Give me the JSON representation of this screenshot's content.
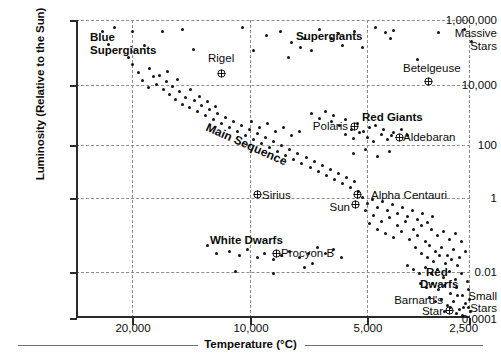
{
  "chart_data": {
    "type": "scatter",
    "xlabel": "Temperature",
    "xunit": "(°C)",
    "ylabel": "Luminosity (Relative to the Sun)",
    "xlim": [
      25000,
      2500
    ],
    "ylim": [
      0.0001,
      1000000
    ],
    "xscale": "reversed-linear-ish",
    "yscale": "log",
    "grid": true,
    "legend": "none",
    "xticks": [
      {
        "label": "20,000",
        "value": 20000
      },
      {
        "label": "10,000",
        "value": 10000
      },
      {
        "label": "5,000",
        "value": 5000
      },
      {
        "label": "2,500",
        "value": 2500
      }
    ],
    "yticks": [
      {
        "label": "1,000,000",
        "value": 1000000
      },
      {
        "label": "10,000",
        "value": 10000
      },
      {
        "label": "100",
        "value": 100
      },
      {
        "label": "1",
        "value": 1
      },
      {
        "label": "0.01",
        "value": 0.01
      },
      {
        "label": "0.0001",
        "value": 0.0001
      }
    ],
    "y_axis_extra_labels": [
      {
        "label": "Massive",
        "near": "1,000,000"
      },
      {
        "label": "Stars",
        "near": "1,000,000"
      },
      {
        "label": "Small",
        "near": "0.0001"
      },
      {
        "label": "Stars",
        "near": "0.0001"
      }
    ],
    "region_labels": [
      {
        "name": "Blue Supergiants",
        "lines": [
          "Blue",
          "Supergiants"
        ]
      },
      {
        "name": "Supergiants",
        "lines": [
          "Supergiants"
        ]
      },
      {
        "name": "Main Sequence",
        "lines": [
          "Main Sequence"
        ]
      },
      {
        "name": "Red Giants",
        "lines": [
          "Red Giants"
        ]
      },
      {
        "name": "White Dwarfs",
        "lines": [
          "White Dwarfs"
        ]
      },
      {
        "name": "Red Dwarfs",
        "lines": [
          "Red",
          "Dwarfs"
        ]
      }
    ],
    "named_stars": [
      {
        "name": "Rigel",
        "lines": [
          "Rigel"
        ],
        "temperature": 11000,
        "luminosity": 40000
      },
      {
        "name": "Betelgeuse",
        "lines": [
          "Betelgeuse"
        ],
        "temperature": 3500,
        "luminosity": 14000
      },
      {
        "name": "Polaris",
        "lines": [
          "Polaris"
        ],
        "temperature": 6000,
        "luminosity": 200
      },
      {
        "name": "Aldebaran",
        "lines": [
          "Aldebaran"
        ],
        "temperature": 4000,
        "luminosity": 120
      },
      {
        "name": "Sirius",
        "lines": [
          "Sirius"
        ],
        "temperature": 9500,
        "luminosity": 1.2
      },
      {
        "name": "Alpha Centauri",
        "lines": [
          "Alpha Centauri"
        ],
        "temperature": 5500,
        "luminosity": 1.2
      },
      {
        "name": "Sun",
        "lines": [
          "Sun"
        ],
        "temperature": 5500,
        "luminosity": 1
      },
      {
        "name": "Procyon B",
        "lines": [
          "Procyon B"
        ],
        "temperature": 8000,
        "luminosity": 0.02
      },
      {
        "name": "Barnard's Star",
        "lines": [
          "Barnard's",
          "Star"
        ],
        "temperature": 3000,
        "luminosity": 0.0005
      }
    ],
    "series": [
      {
        "name": "stars",
        "marker": "dot",
        "color": "#121212",
        "points_px": [
          [
            101,
            30
          ],
          [
            113,
            26
          ],
          [
            107,
            43
          ],
          [
            127,
            56
          ],
          [
            131,
            30
          ],
          [
            143,
            44
          ],
          [
            161,
            30
          ],
          [
            181,
            28
          ],
          [
            192,
            48
          ],
          [
            241,
            26
          ],
          [
            252,
            49
          ],
          [
            265,
            34
          ],
          [
            279,
            30
          ],
          [
            287,
            56
          ],
          [
            290,
            41
          ],
          [
            299,
            46
          ],
          [
            303,
            37
          ],
          [
            310,
            49
          ],
          [
            318,
            28
          ],
          [
            330,
            37
          ],
          [
            337,
            32
          ],
          [
            341,
            44
          ],
          [
            353,
            30
          ],
          [
            361,
            46
          ],
          [
            374,
            26
          ],
          [
            384,
            31
          ],
          [
            389,
            37
          ],
          [
            392,
            29
          ],
          [
            416,
            58
          ],
          [
            437,
            31
          ],
          [
            463,
            28
          ],
          [
            470,
            40
          ],
          [
            131,
            63
          ],
          [
            137,
            71
          ],
          [
            141,
            79
          ],
          [
            148,
            67
          ],
          [
            152,
            75
          ],
          [
            147,
            86
          ],
          [
            155,
            83
          ],
          [
            158,
            74
          ],
          [
            162,
            88
          ],
          [
            165,
            80
          ],
          [
            168,
            93
          ],
          [
            171,
            85
          ],
          [
            174,
            98
          ],
          [
            178,
            90
          ],
          [
            181,
            103
          ],
          [
            166,
            70
          ],
          [
            176,
            78
          ],
          [
            184,
            96
          ],
          [
            188,
            106
          ],
          [
            193,
            99
          ],
          [
            196,
            110
          ],
          [
            200,
            104
          ],
          [
            204,
            114
          ],
          [
            208,
            108
          ],
          [
            212,
            118
          ],
          [
            216,
            112
          ],
          [
            220,
            122
          ],
          [
            224,
            116
          ],
          [
            228,
            126
          ],
          [
            232,
            120
          ],
          [
            236,
            130
          ],
          [
            240,
            124
          ],
          [
            189,
            88
          ],
          [
            198,
            95
          ],
          [
            206,
            100
          ],
          [
            214,
            105
          ],
          [
            244,
            134
          ],
          [
            248,
            128
          ],
          [
            252,
            138
          ],
          [
            256,
            132
          ],
          [
            260,
            142
          ],
          [
            264,
            136
          ],
          [
            268,
            146
          ],
          [
            272,
            140
          ],
          [
            276,
            150
          ],
          [
            280,
            144
          ],
          [
            284,
            154
          ],
          [
            288,
            148
          ],
          [
            292,
            158
          ],
          [
            296,
            152
          ],
          [
            300,
            162
          ],
          [
            250,
            120
          ],
          [
            258,
            126
          ],
          [
            266,
            122
          ],
          [
            274,
            130
          ],
          [
            282,
            126
          ],
          [
            290,
            134
          ],
          [
            298,
            130
          ],
          [
            305,
            156
          ],
          [
            309,
            166
          ],
          [
            313,
            160
          ],
          [
            317,
            170
          ],
          [
            321,
            164
          ],
          [
            325,
            174
          ],
          [
            329,
            168
          ],
          [
            333,
            178
          ],
          [
            337,
            172
          ],
          [
            341,
            182
          ],
          [
            345,
            176
          ],
          [
            349,
            186
          ],
          [
            353,
            180
          ],
          [
            357,
            190
          ],
          [
            330,
            120
          ],
          [
            338,
            124
          ],
          [
            344,
            118
          ],
          [
            350,
            128
          ],
          [
            356,
            122
          ],
          [
            362,
            130
          ],
          [
            368,
            126
          ],
          [
            310,
            112
          ],
          [
            318,
            117
          ],
          [
            324,
            110
          ],
          [
            332,
            114
          ],
          [
            344,
            133
          ],
          [
            352,
            137
          ],
          [
            358,
            131
          ],
          [
            366,
            136
          ],
          [
            372,
            140
          ],
          [
            380,
            133
          ],
          [
            386,
            138
          ],
          [
            392,
            131
          ],
          [
            374,
            124
          ],
          [
            382,
            128
          ],
          [
            390,
            134
          ],
          [
            400,
            128
          ],
          [
            406,
            134
          ],
          [
            352,
            152
          ],
          [
            364,
            148
          ],
          [
            376,
            155
          ],
          [
            388,
            150
          ],
          [
            361,
            196
          ],
          [
            366,
            202
          ],
          [
            371,
            198
          ],
          [
            376,
            206
          ],
          [
            381,
            200
          ],
          [
            386,
            209
          ],
          [
            391,
            203
          ],
          [
            396,
            212
          ],
          [
            401,
            206
          ],
          [
            406,
            215
          ],
          [
            411,
            209
          ],
          [
            416,
            218
          ],
          [
            421,
            212
          ],
          [
            426,
            221
          ],
          [
            431,
            215
          ],
          [
            364,
            209
          ],
          [
            372,
            214
          ],
          [
            380,
            220
          ],
          [
            388,
            216
          ],
          [
            396,
            224
          ],
          [
            404,
            220
          ],
          [
            412,
            228
          ],
          [
            420,
            224
          ],
          [
            368,
            222
          ],
          [
            376,
            228
          ],
          [
            384,
            232
          ],
          [
            392,
            236
          ],
          [
            400,
            230
          ],
          [
            408,
            238
          ],
          [
            416,
            234
          ],
          [
            424,
            240
          ],
          [
            430,
            228
          ],
          [
            436,
            234
          ],
          [
            442,
            230
          ],
          [
            448,
            238
          ],
          [
            454,
            232
          ],
          [
            460,
            240
          ],
          [
            428,
            244
          ],
          [
            434,
            250
          ],
          [
            440,
            246
          ],
          [
            446,
            254
          ],
          [
            452,
            248
          ],
          [
            458,
            256
          ],
          [
            464,
            250
          ],
          [
            414,
            246
          ],
          [
            420,
            252
          ],
          [
            426,
            256
          ],
          [
            432,
            260
          ],
          [
            438,
            254
          ],
          [
            444,
            262
          ],
          [
            450,
            258
          ],
          [
            456,
            264
          ],
          [
            424,
            266
          ],
          [
            430,
            272
          ],
          [
            436,
            268
          ],
          [
            442,
            276
          ],
          [
            448,
            270
          ],
          [
            454,
            278
          ],
          [
            460,
            272
          ],
          [
            466,
            280
          ],
          [
            418,
            272
          ],
          [
            412,
            268
          ],
          [
            406,
            264
          ],
          [
            431,
            282
          ],
          [
            437,
            288
          ],
          [
            443,
            284
          ],
          [
            449,
            292
          ],
          [
            455,
            286
          ],
          [
            461,
            294
          ],
          [
            467,
            288
          ],
          [
            425,
            286
          ],
          [
            419,
            282
          ],
          [
            440,
            298
          ],
          [
            446,
            304
          ],
          [
            452,
            300
          ],
          [
            458,
            308
          ],
          [
            464,
            302
          ],
          [
            469,
            310
          ],
          [
            434,
            300
          ],
          [
            428,
            296
          ],
          [
            456,
            294
          ],
          [
            462,
            306
          ],
          [
            468,
            298
          ],
          [
            443,
            310
          ],
          [
            449,
            306
          ],
          [
            455,
            312
          ],
          [
            461,
            314
          ],
          [
            467,
            306
          ],
          [
            206,
            244
          ],
          [
            228,
            250
          ],
          [
            246,
            248
          ],
          [
            256,
            256
          ],
          [
            263,
            252
          ],
          [
            272,
            258
          ],
          [
            288,
            250
          ],
          [
            298,
            256
          ],
          [
            215,
            252
          ],
          [
            238,
            254
          ],
          [
            280,
            254
          ],
          [
            307,
            252
          ],
          [
            234,
            270
          ],
          [
            272,
            272
          ],
          [
            316,
            246
          ],
          [
            324,
            252
          ],
          [
            332,
            248
          ],
          [
            340,
            256
          ],
          [
            303,
            266
          ],
          [
            311,
            262
          ]
        ]
      }
    ]
  },
  "axes": {
    "y_title": "Luminosity (Relative to the Sun)",
    "x_title": "Temperature",
    "x_unit": "(°C)"
  },
  "labels": {
    "blue_supergiants_l1": "Blue",
    "blue_supergiants_l2": "Supergiants",
    "supergiants": "Supergiants",
    "main_sequence": "Main Sequence",
    "red_giants": "Red Giants",
    "white_dwarfs": "White Dwarfs",
    "red_dwarfs_l1": "Red",
    "red_dwarfs_l2": "Dwarfs",
    "rigel": "Rigel",
    "betelgeuse": "Betelgeuse",
    "polaris": "Polaris",
    "aldebaran": "Aldebaran",
    "sirius": "Sirius",
    "alpha_centauri": "Alpha Centauri",
    "sun": "Sun",
    "procyon_b": "Procyon B",
    "barnards_l1": "Barnard's",
    "barnards_l2": "Star",
    "massive": "Massive",
    "massive_stars": "Stars",
    "small": "Small",
    "small_stars": "Stars"
  },
  "ytick_labels": {
    "t0": "1,000,000",
    "t1": "10,000",
    "t2": "100",
    "t3": "1",
    "t4": "0.01",
    "t5": "0.0001"
  },
  "xtick_labels": {
    "t0": "20,000",
    "t1": "10,000",
    "t2": "5,000",
    "t3": "2,500"
  },
  "colors": {
    "point": "#121212",
    "axis": "#2a2a2a",
    "grid": "#8d8d8d",
    "text": "#0b0b0b"
  }
}
